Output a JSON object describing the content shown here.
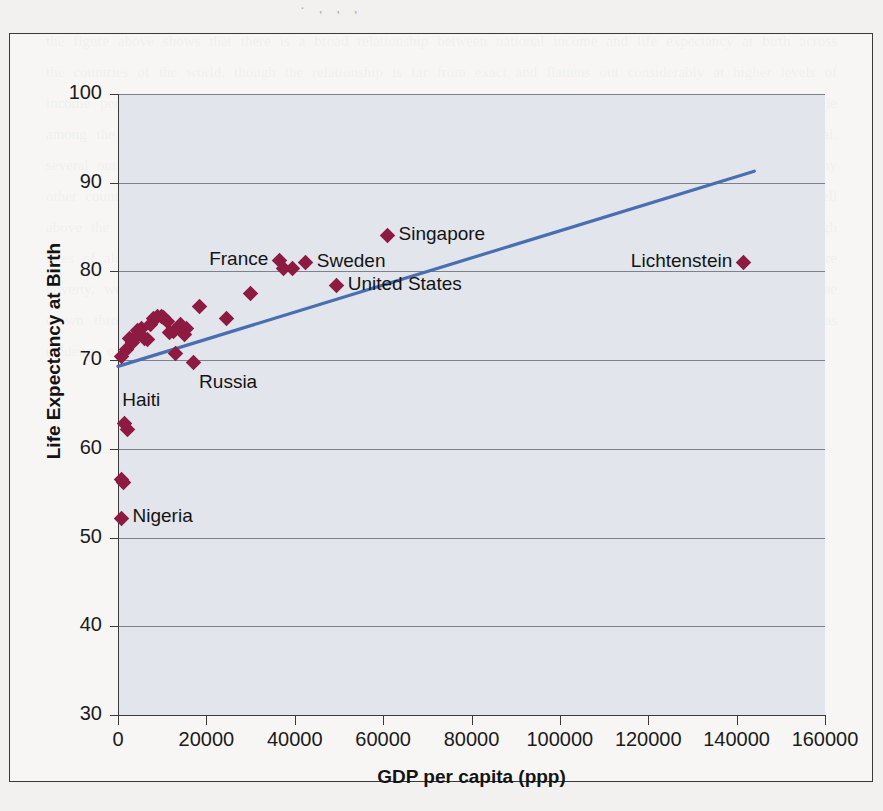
{
  "figure": {
    "crop_text_top": "· , , ,",
    "showthrough_text": "the figure above shows that there is a broad relationship between national income and life expectancy at birth across the countries of the world, though the relationship is far from exact and flattens out considerably at higher levels of income per head. beyond a certain threshold additional income appears to buy relatively little extra longevity, while among the poorest nations even modest gains in gdp per capita are associated with large improvements in survival. several outliers are worth noting in this context. the united states spends far more per person on health care than any other country yet records a life expectancy below that of france, sweden and japan. singapore and lichtenstein sit well above the fitted line, while russia and a number of the post soviet states fall conspicuously below it, reflecting high rates of alcohol related mortality among adult men. haiti and nigeria illustrate the lower end of the distribution, where poverty, weak public health systems and infectious disease combine to depress average survival. the fitted trend line drawn through the scatter should therefore be read as a summary of a loose statistical association rather than as evidence of a simple causal mechanism running from income to health."
  },
  "chart_data": {
    "type": "scatter",
    "title": "",
    "xlabel": "GDP per capita (ppp)",
    "ylabel": "Life Expectancy at Birth",
    "xlim": [
      0,
      160000
    ],
    "ylim": [
      30,
      100
    ],
    "xticks": [
      0,
      20000,
      40000,
      60000,
      80000,
      100000,
      120000,
      140000,
      160000
    ],
    "yticks": [
      30,
      40,
      50,
      60,
      70,
      80,
      90,
      100
    ],
    "xtick_labels": [
      "0",
      "20000",
      "40000",
      "60000",
      "80000",
      "100000",
      "120000",
      "140000",
      "160000"
    ],
    "ytick_labels": [
      "30",
      "40",
      "50",
      "60",
      "70",
      "80",
      "90",
      "100"
    ],
    "grid": "horizontal",
    "legend": "none",
    "marker_color": "#8d1b41",
    "marker_shape": "diamond",
    "plot_background": "#e2e5ec",
    "points": [
      {
        "x": 800,
        "y": 52.2
      },
      {
        "x": 700,
        "y": 56.6
      },
      {
        "x": 1200,
        "y": 56.2
      },
      {
        "x": 1400,
        "y": 62.9
      },
      {
        "x": 2100,
        "y": 62.2
      },
      {
        "x": 900,
        "y": 70.4
      },
      {
        "x": 2000,
        "y": 71.2
      },
      {
        "x": 2600,
        "y": 72.4
      },
      {
        "x": 3300,
        "y": 72.0
      },
      {
        "x": 3900,
        "y": 72.6
      },
      {
        "x": 4300,
        "y": 73.3
      },
      {
        "x": 4700,
        "y": 73.0
      },
      {
        "x": 5300,
        "y": 73.6
      },
      {
        "x": 6100,
        "y": 72.4
      },
      {
        "x": 6600,
        "y": 72.3
      },
      {
        "x": 7400,
        "y": 74.0
      },
      {
        "x": 8100,
        "y": 74.7
      },
      {
        "x": 9000,
        "y": 74.9
      },
      {
        "x": 9800,
        "y": 74.9
      },
      {
        "x": 10400,
        "y": 74.8
      },
      {
        "x": 11100,
        "y": 74.3
      },
      {
        "x": 11600,
        "y": 73.1
      },
      {
        "x": 12600,
        "y": 73.2
      },
      {
        "x": 13100,
        "y": 70.7
      },
      {
        "x": 14200,
        "y": 74.0
      },
      {
        "x": 15000,
        "y": 72.9
      },
      {
        "x": 15500,
        "y": 73.6
      },
      {
        "x": 17000,
        "y": 69.7
      },
      {
        "x": 18500,
        "y": 76.0
      },
      {
        "x": 24500,
        "y": 74.7
      },
      {
        "x": 30000,
        "y": 77.5
      },
      {
        "x": 36500,
        "y": 81.2
      },
      {
        "x": 37500,
        "y": 80.3
      },
      {
        "x": 39500,
        "y": 80.3
      },
      {
        "x": 42500,
        "y": 81.0
      },
      {
        "x": 49500,
        "y": 78.4
      },
      {
        "x": 61000,
        "y": 84.0
      },
      {
        "x": 141500,
        "y": 81.0
      }
    ],
    "annotations": [
      {
        "label": "France",
        "x": 36500,
        "y": 81.2,
        "side": "left"
      },
      {
        "label": "Sweden",
        "x": 42500,
        "y": 81.0,
        "side": "right"
      },
      {
        "label": "Singapore",
        "x": 61000,
        "y": 84.0,
        "side": "right"
      },
      {
        "label": "United States",
        "x": 49500,
        "y": 78.4,
        "side": "right"
      },
      {
        "label": "Lichtenstein",
        "x": 141500,
        "y": 81.0,
        "side": "left"
      },
      {
        "label": "Russia",
        "x": 17000,
        "y": 69.7,
        "side": "below-right"
      },
      {
        "label": "Haiti",
        "x": 1400,
        "y": 62.9,
        "side": "above-right"
      },
      {
        "label": "Nigeria",
        "x": 800,
        "y": 52.2,
        "side": "right"
      }
    ],
    "trendline": {
      "color": "#4a6fb0",
      "x0": 0,
      "y0": 69.3,
      "x1": 144000,
      "y1": 91.3
    }
  }
}
